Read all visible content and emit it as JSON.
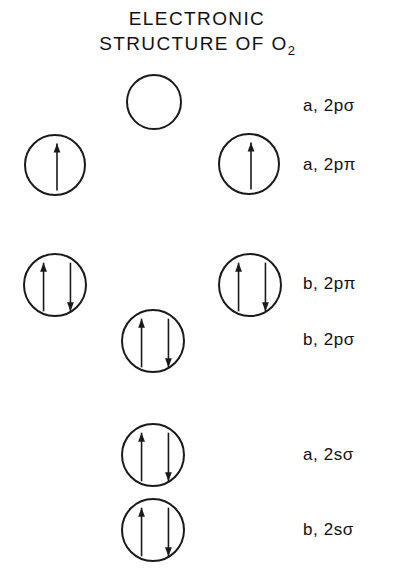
{
  "title": {
    "line1": "ELECTRONIC",
    "line2_main": "STRUCTURE OF O",
    "line2_sub": "2",
    "full": "ELECTRONIC STRUCTURE OF O2"
  },
  "colors": {
    "stroke": "#1a1a1a",
    "text": "#111111",
    "background": "#ffffff"
  },
  "levels": [
    {
      "id": "a-2p-sigma",
      "label": "a, 2pσ",
      "label_x": 303,
      "label_y": 96,
      "orbitals": [
        {
          "cx": 154,
          "cy": 102,
          "r": 28,
          "electrons": []
        }
      ]
    },
    {
      "id": "a-2p-pi",
      "label": "a, 2pπ",
      "label_x": 303,
      "label_y": 155,
      "orbitals": [
        {
          "cx": 55,
          "cy": 165,
          "r": 31,
          "electrons": [
            "up"
          ]
        },
        {
          "cx": 249,
          "cy": 164,
          "r": 31,
          "electrons": [
            "up"
          ]
        }
      ]
    },
    {
      "id": "b-2p-pi",
      "label": "b, 2pπ",
      "label_x": 303,
      "label_y": 274,
      "orbitals": [
        {
          "cx": 55,
          "cy": 285,
          "r": 32,
          "electrons": [
            "up",
            "down"
          ]
        },
        {
          "cx": 250,
          "cy": 285,
          "r": 32,
          "electrons": [
            "up",
            "down"
          ]
        }
      ]
    },
    {
      "id": "b-2p-sigma",
      "label": "b, 2pσ",
      "label_x": 303,
      "label_y": 330,
      "orbitals": [
        {
          "cx": 153,
          "cy": 341,
          "r": 32,
          "electrons": [
            "up",
            "down"
          ]
        }
      ]
    },
    {
      "id": "a-2s-sigma",
      "label": "a, 2sσ",
      "label_x": 303,
      "label_y": 445,
      "orbitals": [
        {
          "cx": 153,
          "cy": 455,
          "r": 32,
          "electrons": [
            "up",
            "down"
          ]
        }
      ]
    },
    {
      "id": "b-2s-sigma",
      "label": "b, 2sσ",
      "label_x": 303,
      "label_y": 520,
      "orbitals": [
        {
          "cx": 153,
          "cy": 530,
          "r": 32,
          "electrons": [
            "up",
            "down"
          ]
        }
      ]
    }
  ]
}
